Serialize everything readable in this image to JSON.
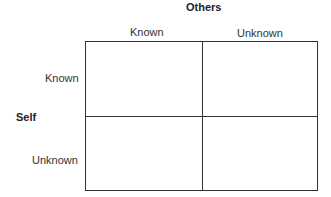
{
  "diagram": {
    "top_axis": {
      "title": "Others",
      "columns": [
        "Known",
        "Unknown"
      ]
    },
    "left_axis": {
      "title": "Self",
      "rows": [
        "Known",
        "Unknown"
      ]
    },
    "quadrants": [
      "",
      "",
      "",
      ""
    ],
    "line_color": "#333333"
  }
}
